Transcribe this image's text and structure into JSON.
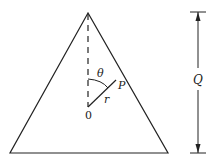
{
  "diagram": {
    "labels": {
      "theta": "θ",
      "point": "P",
      "radius": "r",
      "origin": "0",
      "height": "Q"
    },
    "colors": {
      "stroke": "#222222",
      "background": "#ffffff"
    }
  }
}
